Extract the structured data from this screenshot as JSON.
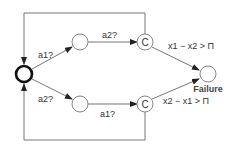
{
  "diagram": {
    "nodes": [
      {
        "id": "initial",
        "label": "",
        "type": "initial"
      },
      {
        "id": "top-mid",
        "label": ""
      },
      {
        "id": "top-c",
        "label": "C"
      },
      {
        "id": "bottom-mid",
        "label": ""
      },
      {
        "id": "bottom-c",
        "label": "C"
      },
      {
        "id": "failure",
        "label": "Failure"
      }
    ],
    "edges": [
      {
        "from": "initial",
        "to": "top-mid",
        "label": "a1?"
      },
      {
        "from": "top-mid",
        "to": "top-c",
        "label": "a2?"
      },
      {
        "from": "top-c",
        "to": "failure",
        "label": "x1 − x2 > Π"
      },
      {
        "from": "top-c",
        "to": "initial",
        "label": ""
      },
      {
        "from": "initial",
        "to": "bottom-mid",
        "label": "a2?"
      },
      {
        "from": "bottom-mid",
        "to": "bottom-c",
        "label": "a1?"
      },
      {
        "from": "bottom-c",
        "to": "failure",
        "label": "x2 − x1 > Π"
      },
      {
        "from": "bottom-c",
        "to": "initial",
        "label": ""
      }
    ]
  }
}
